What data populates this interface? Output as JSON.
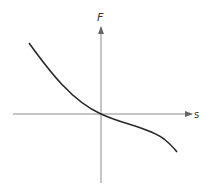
{
  "diagram": {
    "y_axis_label": "F",
    "x_axis_label": "s",
    "axis_color": "#8a8a8a",
    "curve_color": "#2a2a2a",
    "curve_description": "Decreasing curve passing through the origin: steep and concave-up in the upper-left quadrant, flattening near the origin, then curving more steeply downward into the lower-right quadrant"
  }
}
